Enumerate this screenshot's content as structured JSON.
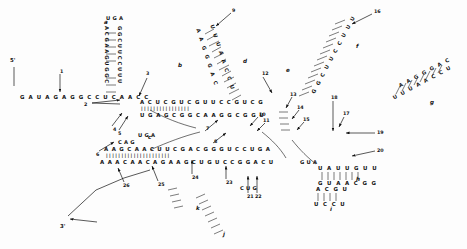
{
  "figure": {
    "type": "rna-secondary-structure",
    "ends": {
      "five_prime": "5'",
      "three_prime": "3'"
    },
    "ink_color": "#111111",
    "background": "#ffffff"
  },
  "helix_labels": [
    {
      "id": "a",
      "text": "a",
      "x": 104,
      "y": 20
    },
    {
      "id": "b",
      "text": "b",
      "x": 178,
      "y": 63
    },
    {
      "id": "c",
      "text": "c",
      "x": 148,
      "y": 135
    },
    {
      "id": "d",
      "text": "d",
      "x": 243,
      "y": 59
    },
    {
      "id": "e",
      "text": "e",
      "x": 286,
      "y": 68
    },
    {
      "id": "f",
      "text": "f",
      "x": 356,
      "y": 44
    },
    {
      "id": "g",
      "text": "g",
      "x": 430,
      "y": 100
    },
    {
      "id": "h",
      "text": "h",
      "x": 356,
      "y": 177
    },
    {
      "id": "i",
      "text": "i",
      "x": 330,
      "y": 207
    },
    {
      "id": "j",
      "text": "j",
      "x": 223,
      "y": 232
    },
    {
      "id": "k",
      "text": "k",
      "x": 196,
      "y": 206
    }
  ],
  "site_numbers": [
    {
      "n": "1",
      "x": 60,
      "y": 70
    },
    {
      "n": "2",
      "x": 84,
      "y": 103
    },
    {
      "n": "3",
      "x": 146,
      "y": 72
    },
    {
      "n": "4",
      "x": 113,
      "y": 128
    },
    {
      "n": "5",
      "x": 118,
      "y": 132
    },
    {
      "n": "6",
      "x": 96,
      "y": 153
    },
    {
      "n": "7",
      "x": 206,
      "y": 127
    },
    {
      "n": "8",
      "x": 214,
      "y": 140
    },
    {
      "n": "9",
      "x": 232,
      "y": 9
    },
    {
      "n": "10",
      "x": 259,
      "y": 113
    },
    {
      "n": "11",
      "x": 263,
      "y": 119
    },
    {
      "n": "12",
      "x": 262,
      "y": 72
    },
    {
      "n": "13",
      "x": 290,
      "y": 93
    },
    {
      "n": "14",
      "x": 297,
      "y": 106
    },
    {
      "n": "15",
      "x": 303,
      "y": 118
    },
    {
      "n": "16",
      "x": 374,
      "y": 10
    },
    {
      "n": "17",
      "x": 343,
      "y": 112
    },
    {
      "n": "18",
      "x": 331,
      "y": 96
    },
    {
      "n": "19",
      "x": 377,
      "y": 131
    },
    {
      "n": "20",
      "x": 377,
      "y": 149
    },
    {
      "n": "21",
      "x": 247,
      "y": 195
    },
    {
      "n": "22",
      "x": 255,
      "y": 195
    },
    {
      "n": "23",
      "x": 226,
      "y": 181
    },
    {
      "n": "24",
      "x": 192,
      "y": 176
    },
    {
      "n": "25",
      "x": 158,
      "y": 183
    },
    {
      "n": "26",
      "x": 123,
      "y": 184
    }
  ],
  "sequences": {
    "five_prime_tail": "G A U A G A G G C C U C A A C C",
    "helix_b_top": "A C U C G U C G U U C C G U C G",
    "helix_b_bottom": "U G A G C G G C A A G G C G G U",
    "helix_c_top": "A A G C A A C U U C G A C G G G U C C U G A",
    "helix_c_bottom": "A A A C A A C A G A A G C U G U C C G G A C U",
    "hairpin_a_left": "A C G A A G U G G C",
    "hairpin_a_right": "G G C U U C C U U U",
    "hairpin_a_loop": "U G A",
    "helix_h_top": "U A U U G U U",
    "helix_h_bottom": "G U A A C G G",
    "helix_i_top": "A C G U",
    "helix_i_bottom": "U C C U",
    "helix_g_top": "A A G G G A C",
    "helix_g_bottom": "U U U A A C C U",
    "loop_text_1": "U G A",
    "loop_text_2": "C A G",
    "loop_text_3": "G U A",
    "loop_text_4": "C U G"
  },
  "callouts": {
    "five_prime_label": "5'",
    "three_prime_label": "3'"
  }
}
